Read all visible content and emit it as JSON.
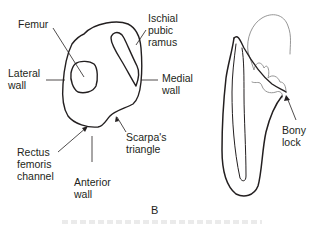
{
  "panel_label": "B",
  "left_figure": {
    "labels": {
      "femur": "Femur",
      "ischial_pubic_ramus": "Ischial\npubic\nramus",
      "lateral_wall": "Lateral\nwall",
      "medial_wall": "Medial\nwall",
      "rectus_femoris_channel": "Rectus\nfemoris\nchannel",
      "scarpas_triangle": "Scarpa's\ntriangle",
      "anterior_wall": "Anterior\nwall"
    }
  },
  "right_figure": {
    "labels": {
      "bony_lock": "Bony\nlock"
    }
  },
  "colors": {
    "line": "#231f20",
    "faint_line": "#8a8a8a"
  }
}
